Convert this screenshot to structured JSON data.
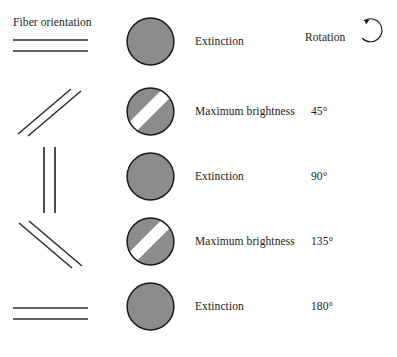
{
  "figure": {
    "columns": {
      "fiber_orientation_header": "Fiber orientation",
      "rotation_header": "Rotation"
    },
    "colors": {
      "disc_fill": "#8c8c8c",
      "disc_stroke": "#1a1a1a",
      "band_fill": "#ffffff",
      "fiber_line": "#2b2b2b",
      "background": "#ffffff",
      "text": "#1a1a1a"
    },
    "icons": {
      "rotation_arrow": "counterclockwise-rotation-arrow-icon"
    },
    "rows": [
      {
        "fiber_angle_deg": 0,
        "fiber_orientation_name": "horizontal",
        "appearance": "Extinction",
        "band_visible": false,
        "band_angle_deg": 0,
        "rotation": ""
      },
      {
        "fiber_angle_deg": 45,
        "fiber_orientation_name": "diagonal-up-right",
        "appearance": "Maximum brightness",
        "band_visible": true,
        "band_angle_deg": 45,
        "rotation": "45°"
      },
      {
        "fiber_angle_deg": 90,
        "fiber_orientation_name": "vertical",
        "appearance": "Extinction",
        "band_visible": false,
        "band_angle_deg": 0,
        "rotation": "90°"
      },
      {
        "fiber_angle_deg": 135,
        "fiber_orientation_name": "diagonal-down-right",
        "appearance": "Maximum brightness",
        "band_visible": true,
        "band_angle_deg": 45,
        "rotation": "135°"
      },
      {
        "fiber_angle_deg": 180,
        "fiber_orientation_name": "horizontal",
        "appearance": "Extinction",
        "band_visible": false,
        "band_angle_deg": 0,
        "rotation": "180°"
      }
    ]
  }
}
